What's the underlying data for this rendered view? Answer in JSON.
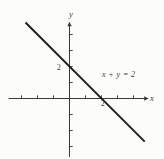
{
  "figure": {
    "background": "#fcfcfa",
    "axis_color": "#3a3a3a",
    "line_color": "#1d1d1d",
    "text_color": "#3d3d3d"
  },
  "chart_data": {
    "type": "line",
    "title": "",
    "xlabel": "x",
    "ylabel": "y",
    "equation": "x + y = 2",
    "series": [
      {
        "name": "x + y = 2",
        "x": [
          -2.75,
          4.7
        ],
        "y": [
          4.75,
          -2.7
        ]
      }
    ],
    "x_intercept": 2,
    "y_intercept": 2,
    "xlim": [
      -3.8,
      4.95
    ],
    "ylim": [
      -3.65,
      4.8
    ],
    "x_ticks": [
      -3,
      -2,
      -1,
      1,
      2,
      3,
      4
    ],
    "y_ticks": [
      -3,
      -2,
      -1,
      1,
      2,
      3,
      4
    ],
    "x_tick_labels": {
      "2": "2"
    },
    "y_tick_labels": {
      "2": "2"
    },
    "annotation": {
      "text": "x + y = 2",
      "x": 3.05,
      "y": 1.35
    },
    "grid": false,
    "legend": false
  }
}
